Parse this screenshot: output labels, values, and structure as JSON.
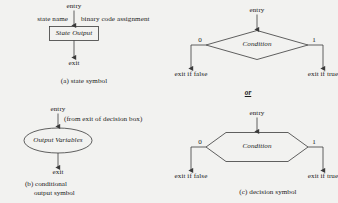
{
  "figure": {
    "background_color": "#f2f2f0",
    "stroke_color": "#3a3a3a"
  },
  "panels": {
    "a": {
      "caption": "(a) state symbol",
      "entry_label": "entry",
      "exit_label": "exit",
      "left_annotation": "state name",
      "right_annotation": "binary code assignment",
      "shape": "rectangle",
      "shape_text": "State Output"
    },
    "b": {
      "caption_line1": "(b) conditional",
      "caption_line2": "output symbol",
      "entry_label": "entry",
      "exit_label": "exit",
      "source_annotation": "(from exit of decision box)",
      "shape": "ellipse",
      "shape_text": "Output Variables"
    },
    "c": {
      "caption": "(c) decision symbol",
      "alternative_separator": "or",
      "variant_diamond": {
        "shape": "diamond",
        "shape_text": "Condition",
        "entry_label": "entry",
        "false_branch_value": "0",
        "true_branch_value": "1",
        "false_exit_label": "exit if false",
        "true_exit_label": "exit if true"
      },
      "variant_hexagon": {
        "shape": "hexagon",
        "shape_text": "Condition",
        "entry_label": "entry",
        "false_branch_value": "0",
        "true_branch_value": "1",
        "false_exit_label": "exit if false",
        "true_exit_label": "exit if true"
      }
    }
  }
}
